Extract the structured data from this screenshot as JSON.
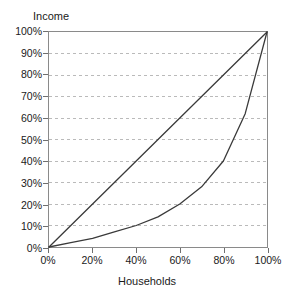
{
  "chart_data": {
    "type": "line",
    "title": "",
    "xlabel": "Households",
    "ylabel": "Income",
    "xlim": [
      0,
      100
    ],
    "ylim": [
      0,
      100
    ],
    "grid": "horizontal-dashed",
    "legend": "none",
    "x_tick_labels": [
      "0%",
      "20%",
      "40%",
      "60%",
      "80%",
      "100%"
    ],
    "x_tick_values": [
      0,
      20,
      40,
      60,
      80,
      100
    ],
    "y_tick_labels": [
      "0%",
      "10%",
      "20%",
      "30%",
      "40%",
      "50%",
      "60%",
      "70%",
      "80%",
      "90%",
      "100%"
    ],
    "y_tick_values": [
      0,
      10,
      20,
      30,
      40,
      50,
      60,
      70,
      80,
      90,
      100
    ],
    "x": [
      0,
      10,
      20,
      30,
      40,
      50,
      60,
      70,
      80,
      90,
      100
    ],
    "series": [
      {
        "name": "line-of-equality",
        "values": [
          0,
          10,
          20,
          30,
          40,
          50,
          60,
          70,
          80,
          90,
          100
        ],
        "color": "#3a3a3a"
      },
      {
        "name": "lorenz-curve",
        "values": [
          0,
          2,
          4,
          7,
          10,
          14,
          20,
          28,
          40,
          62,
          100
        ],
        "color": "#3a3a3a"
      }
    ]
  },
  "axes": {
    "y_title": "Income",
    "x_title": "Households"
  },
  "colors": {
    "line": "#3a3a3a",
    "grid": "#b9b9b9",
    "frame": "#8a8a8a",
    "background": "#ffffff",
    "text": "#1a1a1a"
  }
}
